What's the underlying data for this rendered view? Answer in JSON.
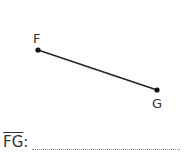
{
  "diagram": {
    "points": [
      {
        "label": "F",
        "x": 38,
        "y": 50
      },
      {
        "label": "G",
        "x": 157,
        "y": 90
      }
    ],
    "segment": {
      "from": "F",
      "to": "G"
    }
  },
  "answer": {
    "segment_label": "FG",
    "colon": ":",
    "blank": ""
  }
}
